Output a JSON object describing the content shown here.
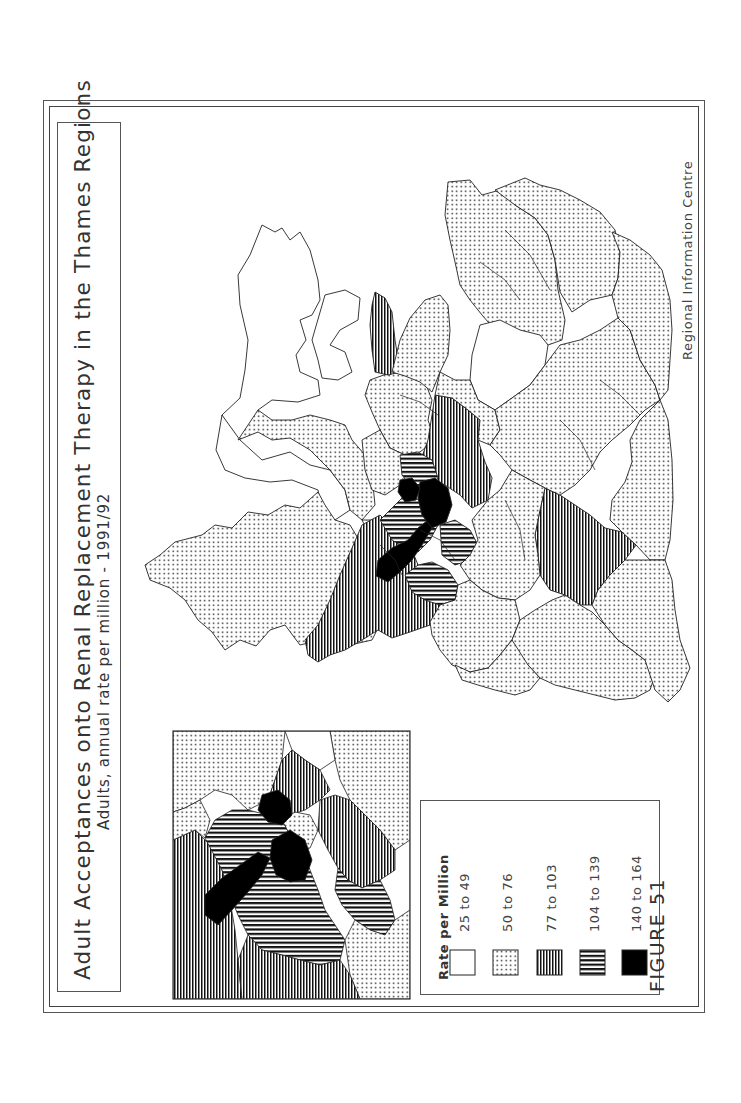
{
  "figure": {
    "title": "Adult Acceptances onto Renal Replacement Therapy in the Thames Regions",
    "subtitle": "Adults, annual rate per million - 1991/92",
    "figure_label": "FIGURE 51",
    "credit": "Regional Information Centre",
    "orientation": "rotated 90° counter-clockwise (landscape page)"
  },
  "legend": {
    "title": "Rate per Million",
    "items": [
      {
        "label": "25 to 49",
        "pattern": "blank",
        "fill": "#ffffff"
      },
      {
        "label": "50 to 76",
        "pattern": "dots",
        "fill": "#ffffff"
      },
      {
        "label": "77 to 103",
        "pattern": "vertical-lines",
        "fill": "#ffffff"
      },
      {
        "label": "104 to 139",
        "pattern": "horizontal-lines",
        "fill": "#ffffff"
      },
      {
        "label": "140 to 164",
        "pattern": "solid",
        "fill": "#000000"
      }
    ]
  },
  "map": {
    "main": "Thames regions districts choropleth",
    "inset": "Enlarged inset of London districts"
  },
  "colors": {
    "ink": "#000000",
    "paper": "#ffffff",
    "frame": "#555555"
  }
}
